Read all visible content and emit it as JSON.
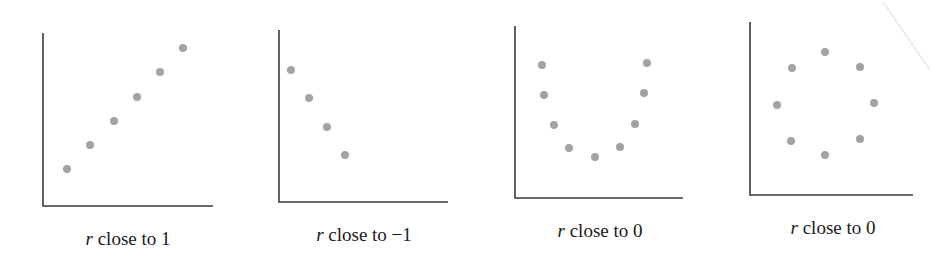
{
  "chart_data": [
    {
      "type": "scatter",
      "title": "",
      "caption_var": "r",
      "caption": "close to 1",
      "xlabel": "",
      "ylabel": "",
      "grid": false,
      "axes_box": {
        "x0": 43,
        "y_top": 33,
        "y0": 206,
        "x_right": 213
      },
      "points": [
        [
          67,
          169
        ],
        [
          90,
          145
        ],
        [
          114,
          121
        ],
        [
          137,
          97
        ],
        [
          160,
          72
        ],
        [
          183,
          48
        ]
      ],
      "caption_x": 128
    },
    {
      "type": "scatter",
      "title": "",
      "caption_var": "r",
      "caption": "close to −1",
      "xlabel": "",
      "ylabel": "",
      "grid": false,
      "axes_box": {
        "x0": 279,
        "y_top": 30,
        "y0": 202,
        "x_right": 448
      },
      "points": [
        [
          291,
          70
        ],
        [
          309,
          98
        ],
        [
          327,
          127
        ],
        [
          345,
          155
        ]
      ],
      "caption_x": 364
    },
    {
      "type": "scatter",
      "title": "",
      "caption_var": "r",
      "caption": "close to 0",
      "xlabel": "",
      "ylabel": "",
      "grid": false,
      "axes_box": {
        "x0": 515,
        "y_top": 26,
        "y0": 198,
        "x_right": 683
      },
      "points": [
        [
          542,
          65
        ],
        [
          544,
          95
        ],
        [
          554,
          125
        ],
        [
          569,
          148
        ],
        [
          595,
          157
        ],
        [
          620,
          147
        ],
        [
          635,
          124
        ],
        [
          644,
          93
        ],
        [
          647,
          63
        ]
      ],
      "caption_x": 600
    },
    {
      "type": "scatter",
      "title": "",
      "caption_var": "r",
      "caption": "close to 0",
      "xlabel": "",
      "ylabel": "",
      "grid": false,
      "axes_box": {
        "x0": 750,
        "y_top": 22,
        "y0": 195,
        "x_right": 913
      },
      "points": [
        [
          825,
          52
        ],
        [
          792,
          68
        ],
        [
          860,
          67
        ],
        [
          777,
          105
        ],
        [
          874,
          103
        ],
        [
          791,
          141
        ],
        [
          860,
          139
        ],
        [
          825,
          155
        ]
      ],
      "caption_x": 833
    }
  ],
  "colors": {
    "point": "#a3a3a3",
    "axis": "#3a3a3a",
    "text": "#1a1a1a"
  }
}
